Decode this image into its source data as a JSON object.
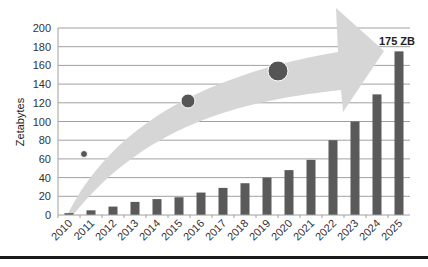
{
  "chart_data": {
    "type": "bar",
    "title": "",
    "xlabel": "",
    "ylabel": "Zetabytes",
    "ylim": [
      0,
      200
    ],
    "yticks": [
      0,
      20,
      40,
      60,
      80,
      100,
      120,
      140,
      160,
      180,
      200
    ],
    "grid": true,
    "legend": null,
    "categories": [
      "2010",
      "2011",
      "2012",
      "2013",
      "2014",
      "2015",
      "2016",
      "2017",
      "2018",
      "2019",
      "2020",
      "2021",
      "2022",
      "2023",
      "2024",
      "2025"
    ],
    "values": [
      2,
      5,
      9,
      14,
      17,
      19,
      24,
      29,
      34,
      40,
      48,
      59,
      80,
      100,
      129,
      175
    ],
    "annotations": [
      {
        "text": "175 ZB",
        "category": "2025",
        "value": 175
      }
    ],
    "decorations": {
      "arrow": "curved upward arrow behind bars",
      "circles": 3
    },
    "colors": {
      "bar": "#5a5a5a",
      "grid": "#a0a0a0",
      "arrow": "#d6d6d6",
      "circle": "#555555"
    }
  }
}
